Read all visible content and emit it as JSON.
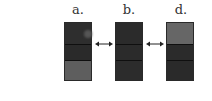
{
  "panels": [
    {
      "label": "a.",
      "segments": [
        {
          "color": "#2e2e2e"
        },
        {
          "color": "#2a2a2a"
        },
        {
          "color": "#5e5e5e"
        }
      ],
      "spot": true
    },
    {
      "label": "b.",
      "segments": [
        {
          "color": "#2b2b2b"
        },
        {
          "color": "#2b2b2b"
        },
        {
          "color": "#2c2c2c"
        }
      ]
    },
    {
      "label": "d.",
      "segments": [
        {
          "color": "#666666"
        },
        {
          "color": "#2b2b2b"
        },
        {
          "color": "#2a2a2a"
        }
      ]
    }
  ],
  "arrows": [
    {
      "type": "double-arrow"
    },
    {
      "type": "double-arrow"
    }
  ]
}
